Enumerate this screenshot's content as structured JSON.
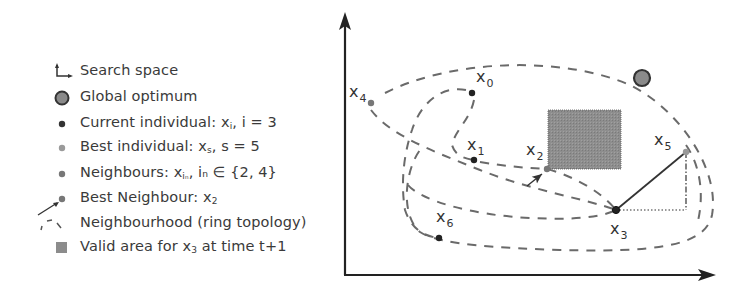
{
  "legend": {
    "items": [
      {
        "icon": "axes-icon",
        "text": "Search space",
        "sub": "",
        "tail": ""
      },
      {
        "icon": "global-optimum-icon",
        "text": "Global optimum",
        "sub": "",
        "tail": ""
      },
      {
        "icon": "current-individual-icon",
        "text": "Current individual: x",
        "sub": "i",
        "tail": ", i = 3"
      },
      {
        "icon": "best-individual-icon",
        "text": "Best individual: x",
        "sub": "s",
        "tail": ", s = 5"
      },
      {
        "icon": "neighbour-icon",
        "text": "Neighbours: x",
        "sub": "iₙ",
        "tail": ", iₙ ∈ {2, 4}"
      },
      {
        "icon": "best-neighbour-icon",
        "text": "Best Neighbour: x",
        "sub": "2",
        "tail": ""
      },
      {
        "icon": "dashed-ring-icon",
        "text": "Neighbourhood (ring topology)",
        "sub": "",
        "tail": ""
      },
      {
        "icon": "valid-area-icon",
        "text": "Valid area for x",
        "sub": "3",
        "tail": " at time t+1"
      }
    ]
  },
  "colors": {
    "axis": "#222222",
    "dash": "#666666",
    "current": "#222222",
    "best": "#999999",
    "neighbour": "#777777",
    "optimum_fill": "#8a8a8a",
    "optimum_stroke": "#333333",
    "area": "#8c8c8c"
  },
  "diagram": {
    "points": [
      {
        "id": "x0",
        "label": "x",
        "sub": "0",
        "x": 472,
        "y": 93,
        "lx": 476,
        "ly": 82,
        "kind": "individual"
      },
      {
        "id": "x1",
        "label": "x",
        "sub": "1",
        "x": 474,
        "y": 160,
        "lx": 467,
        "ly": 150,
        "kind": "individual"
      },
      {
        "id": "x2",
        "label": "x",
        "sub": "2",
        "x": 547,
        "y": 169,
        "lx": 526,
        "ly": 155,
        "kind": "best-neighbour"
      },
      {
        "id": "x3",
        "label": "x",
        "sub": "3",
        "x": 616,
        "y": 210,
        "lx": 610,
        "ly": 234,
        "kind": "current"
      },
      {
        "id": "x4",
        "label": "x",
        "sub": "4",
        "x": 371,
        "y": 103,
        "lx": 349,
        "ly": 97,
        "kind": "neighbour"
      },
      {
        "id": "x5",
        "label": "x",
        "sub": "5",
        "x": 686,
        "y": 152,
        "lx": 654,
        "ly": 145,
        "kind": "best"
      },
      {
        "id": "x6",
        "label": "x",
        "sub": "6",
        "x": 439,
        "y": 238,
        "lx": 436,
        "ly": 222,
        "kind": "individual"
      }
    ],
    "global_optimum": {
      "x": 642,
      "y": 78,
      "r": 8
    },
    "valid_area": {
      "x": 548,
      "y": 110,
      "w": 73,
      "h": 59
    }
  }
}
